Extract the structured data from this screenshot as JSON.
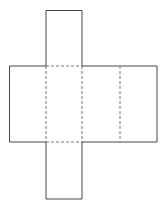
{
  "diagram": {
    "type": "net-of-rectangular-prism",
    "stroke_color": "#333333",
    "dash_color": "#555555",
    "faces": [
      {
        "name": "top-flap",
        "x": 46,
        "y": 10.5,
        "w": 36,
        "h": 55.5
      },
      {
        "name": "front-face",
        "x": 46,
        "y": 66,
        "w": 36,
        "h": 76
      },
      {
        "name": "left-face",
        "x": 9.5,
        "y": 66,
        "w": 36.5,
        "h": 76
      },
      {
        "name": "right-face",
        "x": 82,
        "y": 66,
        "w": 38,
        "h": 76
      },
      {
        "name": "back-face",
        "x": 120,
        "y": 66,
        "w": 37,
        "h": 76
      },
      {
        "name": "bottom-flap",
        "x": 46,
        "y": 142,
        "w": 36,
        "h": 57
      }
    ],
    "fold_lines": [
      {
        "x1": 46,
        "y1": 66,
        "x2": 82,
        "y2": 66
      },
      {
        "x1": 46,
        "y1": 142,
        "x2": 82,
        "y2": 142
      },
      {
        "x1": 46,
        "y1": 66,
        "x2": 46,
        "y2": 142
      },
      {
        "x1": 82,
        "y1": 66,
        "x2": 82,
        "y2": 142
      },
      {
        "x1": 120,
        "y1": 66,
        "x2": 120,
        "y2": 142
      }
    ]
  }
}
